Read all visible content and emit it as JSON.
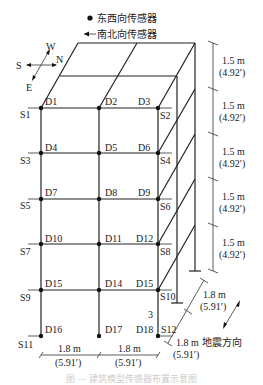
{
  "legend": {
    "ew_sensor": "东西向传感器",
    "ns_sensor": "南北向传感器"
  },
  "compass": {
    "W": "W",
    "N": "N",
    "S": "S",
    "E": "E"
  },
  "dot_labels": [
    "D1",
    "D2",
    "D3",
    "D4",
    "D5",
    "D6",
    "D7",
    "D8",
    "D9",
    "D10",
    "D11",
    "D12",
    "D15",
    "D14",
    "D15",
    "D16",
    "D17",
    "D18"
  ],
  "sensor_labels": [
    "S1",
    "S2",
    "S3",
    "S4",
    "S5",
    "S6",
    "S7",
    "S8",
    "S9",
    "S10",
    "S11",
    "S12"
  ],
  "extra_label": "3",
  "dimensions": {
    "story_height": "1.5 m",
    "story_height_ft": "(4.92′)",
    "bay_width": "1.8 m",
    "bay_width_ft": "(5.91′)"
  },
  "earthquake_direction": "地震方向",
  "caption": "图 — 建筑模型传感器布置示意图"
}
